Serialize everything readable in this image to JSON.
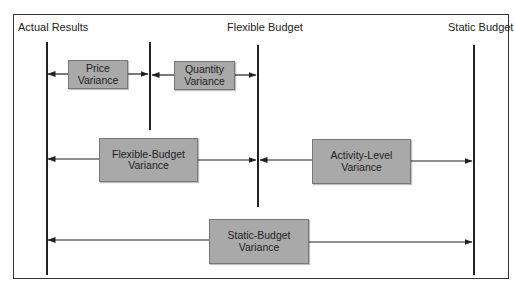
{
  "diagram": {
    "columns": {
      "actual": "Actual Results",
      "flexible": "Flexible Budget",
      "static": "Static Budget"
    },
    "boxes": {
      "price": {
        "line1": "Price",
        "line2": "Variance"
      },
      "quantity": {
        "line1": "Quantity",
        "line2": "Variance"
      },
      "flexible_budget": {
        "line1": "Flexible-Budget",
        "line2": "Variance"
      },
      "activity_level": {
        "line1": "Activity-Level",
        "line2": "Variance"
      },
      "static_budget": {
        "line1": "Static-Budget",
        "line2": "Variance"
      }
    },
    "colors": {
      "box_fill": "#a9a9a9",
      "line": "#222222",
      "frame": "#333333"
    }
  }
}
